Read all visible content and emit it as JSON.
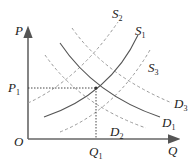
{
  "diagram": {
    "type": "supply-demand",
    "axes": {
      "origin_label": "O",
      "x_label": "Q",
      "y_label": "P"
    },
    "equilibrium": {
      "price_label": "P",
      "price_sub": "1",
      "quantity_label": "Q",
      "quantity_sub": "1"
    },
    "curves": [
      {
        "id": "S1",
        "label": "S",
        "sub": "1",
        "style": "solid",
        "kind": "supply"
      },
      {
        "id": "D1",
        "label": "D",
        "sub": "1",
        "style": "solid",
        "kind": "demand"
      },
      {
        "id": "S2",
        "label": "S",
        "sub": "2",
        "style": "dashed",
        "kind": "supply"
      },
      {
        "id": "S3",
        "label": "S",
        "sub": "3",
        "style": "dashed",
        "kind": "supply"
      },
      {
        "id": "D2",
        "label": "D",
        "sub": "2",
        "style": "dashed",
        "kind": "demand"
      },
      {
        "id": "D3",
        "label": "D",
        "sub": "3",
        "style": "dashed",
        "kind": "demand"
      }
    ],
    "colors": {
      "axis": "#555555",
      "solid_curve": "#444444",
      "dashed_curve": "#999999",
      "guide": "#333333"
    }
  }
}
